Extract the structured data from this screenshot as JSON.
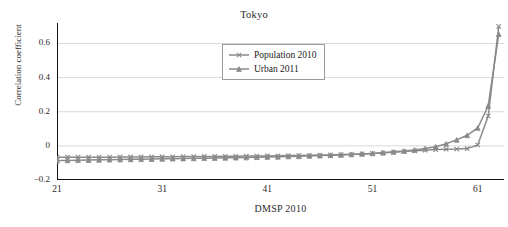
{
  "chart_data": {
    "type": "line",
    "title": "Tokyo",
    "xlabel": "DMSP 2010",
    "ylabel": "Correlation coefficient",
    "xlim": [
      21,
      63.5
    ],
    "ylim": [
      -0.2,
      0.72
    ],
    "grid": true,
    "legend_position": "top-center",
    "x_ticks": [
      "21",
      "31",
      "41",
      "51",
      "61"
    ],
    "x_tick_values": [
      21,
      31,
      41,
      51,
      61
    ],
    "y_ticks": [
      "-0.2",
      "0",
      "0.2",
      "0.4",
      "0.6"
    ],
    "y_tick_values": [
      -0.2,
      0,
      0.2,
      0.4,
      0.6
    ],
    "x": [
      21,
      22,
      23,
      24,
      25,
      26,
      27,
      28,
      29,
      30,
      31,
      32,
      33,
      34,
      35,
      36,
      37,
      38,
      39,
      40,
      41,
      42,
      43,
      44,
      45,
      46,
      47,
      48,
      49,
      50,
      51,
      52,
      53,
      54,
      55,
      56,
      57,
      58,
      59,
      60,
      61,
      62,
      63
    ],
    "series": [
      {
        "name": "Population 2010",
        "marker": "x",
        "color": "#8a8a8a",
        "values": [
          -0.066,
          -0.066,
          -0.066,
          -0.066,
          -0.066,
          -0.066,
          -0.065,
          -0.065,
          -0.065,
          -0.064,
          -0.064,
          -0.064,
          -0.063,
          -0.063,
          -0.062,
          -0.062,
          -0.061,
          -0.061,
          -0.06,
          -0.06,
          -0.059,
          -0.058,
          -0.057,
          -0.056,
          -0.055,
          -0.054,
          -0.053,
          -0.051,
          -0.049,
          -0.047,
          -0.044,
          -0.041,
          -0.037,
          -0.033,
          -0.029,
          -0.025,
          -0.022,
          -0.02,
          -0.019,
          -0.016,
          0.005,
          0.175,
          0.7
        ]
      },
      {
        "name": "Urban 2011",
        "marker": "triangle",
        "color": "#8a8a8a",
        "values": [
          -0.086,
          -0.085,
          -0.084,
          -0.083,
          -0.082,
          -0.081,
          -0.08,
          -0.079,
          -0.078,
          -0.077,
          -0.076,
          -0.075,
          -0.074,
          -0.073,
          -0.072,
          -0.071,
          -0.07,
          -0.069,
          -0.068,
          -0.066,
          -0.065,
          -0.064,
          -0.062,
          -0.061,
          -0.059,
          -0.057,
          -0.055,
          -0.053,
          -0.05,
          -0.047,
          -0.044,
          -0.04,
          -0.035,
          -0.03,
          -0.024,
          -0.016,
          -0.005,
          0.012,
          0.035,
          0.062,
          0.105,
          0.235,
          0.655
        ]
      }
    ]
  },
  "legend": {
    "items": [
      {
        "label": "Population 2010"
      },
      {
        "label": "Urban 2011"
      }
    ]
  }
}
